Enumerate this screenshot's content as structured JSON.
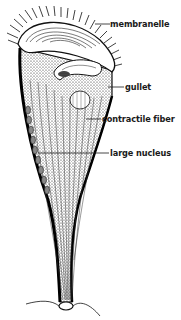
{
  "diagram": {
    "labels": [
      {
        "id": "membranelle",
        "text": "membranelle",
        "x": 110,
        "y": 20,
        "line_from": [
          95,
          24
        ],
        "line_to": [
          110,
          24
        ]
      },
      {
        "id": "gullet",
        "text": "gullet",
        "x": 125,
        "y": 83,
        "line_from": [
          108,
          87
        ],
        "line_to": [
          124,
          87
        ]
      },
      {
        "id": "contractile_fiber",
        "text": "contractile fiber",
        "x": 102,
        "y": 115,
        "line_from": [
          86,
          119
        ],
        "line_to": [
          101,
          119
        ]
      },
      {
        "id": "large_nucleus",
        "text": "large nucleus",
        "x": 110,
        "y": 149,
        "line_from": [
          38,
          153
        ],
        "line_to": [
          109,
          153
        ]
      }
    ],
    "colors": {
      "ink": "#1a1a1a",
      "background": "#ffffff"
    }
  }
}
